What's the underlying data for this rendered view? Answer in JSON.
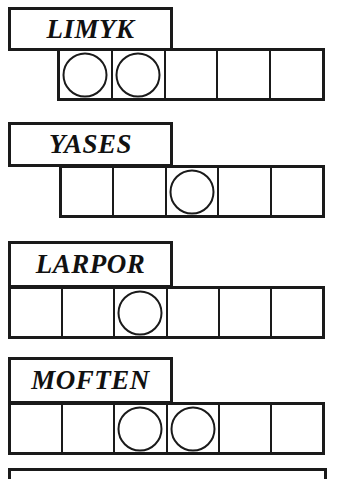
{
  "puzzle": {
    "title_rows": [
      {
        "label": "LIMYK",
        "label_box": {
          "x": 8,
          "y": 7,
          "w": 165,
          "h": 44
        },
        "grid": {
          "x": 57,
          "y": 48,
          "w": 268,
          "h": 53,
          "cells": 5
        },
        "tokens": [
          1,
          1,
          0,
          0,
          0
        ]
      },
      {
        "label": "YASES",
        "label_box": {
          "x": 8,
          "y": 122,
          "w": 165,
          "h": 45
        },
        "grid": {
          "x": 59,
          "y": 165,
          "w": 266,
          "h": 53,
          "cells": 5
        },
        "tokens": [
          0,
          0,
          1,
          0,
          0
        ]
      },
      {
        "label": "LARPOR",
        "label_box": {
          "x": 8,
          "y": 241,
          "w": 165,
          "h": 47
        },
        "grid": {
          "x": 8,
          "y": 286,
          "w": 317,
          "h": 53,
          "cells": 6
        },
        "tokens": [
          0,
          0,
          1,
          0,
          0,
          0
        ]
      },
      {
        "label": "MOFTEN",
        "label_box": {
          "x": 8,
          "y": 357,
          "w": 165,
          "h": 47
        },
        "grid": {
          "x": 8,
          "y": 402,
          "w": 317,
          "h": 53,
          "cells": 6
        },
        "tokens": [
          0,
          0,
          1,
          1,
          0,
          0
        ]
      }
    ],
    "bottom_strip": {
      "x": 8,
      "y": 468,
      "w": 319,
      "h": 11
    },
    "colors": {
      "ink": "#1a1a1a",
      "paper": "#ffffff",
      "text": "#111111"
    },
    "label_font_size_px": 27,
    "token_diameter_px": 45
  }
}
